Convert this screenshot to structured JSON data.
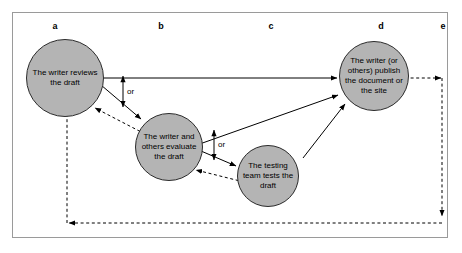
{
  "diagram": {
    "frame_border_color": "#9a9a9a",
    "node_fill_color": "#b4b4b4",
    "node_border_color": "#2b2b2b",
    "line_color": "#000000",
    "column_labels": [
      {
        "id": "a",
        "label": "a"
      },
      {
        "id": "b",
        "label": "b"
      },
      {
        "id": "c",
        "label": "c"
      },
      {
        "id": "d",
        "label": "d"
      },
      {
        "id": "e",
        "label": "e"
      }
    ],
    "nodes": [
      {
        "id": "a",
        "label": "The writer reviews the draft"
      },
      {
        "id": "b",
        "label": "The writer and others evaluate the draft"
      },
      {
        "id": "c",
        "label": "The testing team tests the draft"
      },
      {
        "id": "d",
        "label": "The writer (or others) publish the document or the site"
      }
    ],
    "connector_labels": [
      {
        "id": "or-1",
        "label": "or"
      },
      {
        "id": "or-2",
        "label": "or"
      }
    ]
  }
}
